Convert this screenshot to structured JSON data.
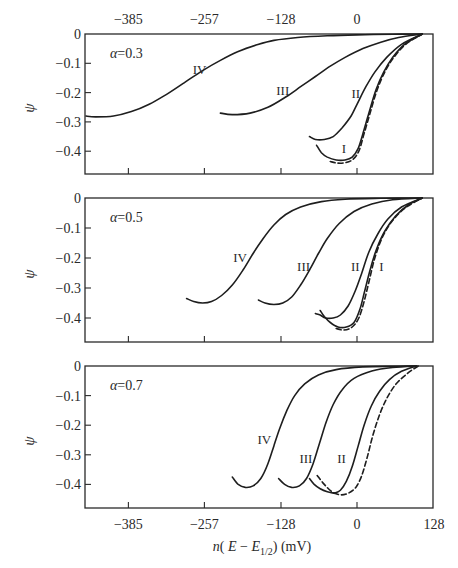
{
  "chart_data": {
    "type": "line",
    "title": "",
    "xlabel": "n(E − E1/2)  (mV)",
    "ylabel": "ψ",
    "x_ticks": [
      -385,
      -257,
      -128,
      0,
      128
    ],
    "x_tick_labels_top": [
      "−385",
      "−257",
      "−128",
      "0"
    ],
    "x_tick_labels_bottom": [
      "−385",
      "−257",
      "−128",
      "0",
      "128"
    ],
    "y_ticks": [
      0,
      -0.1,
      -0.2,
      -0.3,
      -0.4
    ],
    "y_tick_labels": [
      "0",
      "−0.1",
      "−0.2",
      "−0.3",
      "−0.4"
    ],
    "xlim": [
      -385,
      128
    ],
    "ylim": [
      -0.47,
      0
    ],
    "grid": false,
    "legend": "curve labels I, II, III, IV placed inline; dashed line = reference curve",
    "panels": [
      {
        "annotation": "α = 0.3",
        "series": [
          {
            "name": "IV",
            "style": "solid",
            "label_pos": [
              -265,
              -0.12
            ],
            "points": [
              [
                -460,
                -0.28
              ],
              [
                -440,
                -0.283
              ],
              [
                -410,
                -0.28
              ],
              [
                -380,
                -0.265
              ],
              [
                -350,
                -0.24
              ],
              [
                -320,
                -0.205
              ],
              [
                -290,
                -0.165
              ],
              [
                -260,
                -0.125
              ],
              [
                -230,
                -0.09
              ],
              [
                -200,
                -0.06
              ],
              [
                -170,
                -0.038
              ],
              [
                -140,
                -0.022
              ],
              [
                -100,
                -0.012
              ],
              [
                -50,
                -0.006
              ],
              [
                0,
                -0.003
              ],
              [
                60,
                -0.001
              ],
              [
                110,
                0
              ]
            ]
          },
          {
            "name": "III",
            "style": "solid",
            "label_pos": [
              -125,
              -0.19
            ],
            "points": [
              [
                -230,
                -0.27
              ],
              [
                -210,
                -0.275
              ],
              [
                -180,
                -0.27
              ],
              [
                -150,
                -0.25
              ],
              [
                -120,
                -0.215
              ],
              [
                -95,
                -0.18
              ],
              [
                -70,
                -0.145
              ],
              [
                -45,
                -0.11
              ],
              [
                -20,
                -0.08
              ],
              [
                10,
                -0.05
              ],
              [
                40,
                -0.028
              ],
              [
                70,
                -0.012
              ],
              [
                110,
                0
              ]
            ]
          },
          {
            "name": "II",
            "style": "solid",
            "label_pos": [
              -2,
              -0.2
            ],
            "points": [
              [
                -80,
                -0.35
              ],
              [
                -70,
                -0.36
              ],
              [
                -55,
                -0.36
              ],
              [
                -40,
                -0.35
              ],
              [
                -25,
                -0.32
              ],
              [
                -10,
                -0.28
              ],
              [
                0,
                -0.24
              ],
              [
                15,
                -0.18
              ],
              [
                30,
                -0.13
              ],
              [
                50,
                -0.08
              ],
              [
                75,
                -0.035
              ],
              [
                110,
                0
              ]
            ]
          },
          {
            "name": "I",
            "style": "solid",
            "label_pos": [
              -22,
              -0.39
            ],
            "points": [
              [
                -68,
                -0.38
              ],
              [
                -60,
                -0.405
              ],
              [
                -50,
                -0.42
              ],
              [
                -35,
                -0.43
              ],
              [
                -20,
                -0.43
              ],
              [
                -8,
                -0.42
              ],
              [
                2,
                -0.39
              ],
              [
                10,
                -0.34
              ],
              [
                20,
                -0.27
              ],
              [
                32,
                -0.19
              ],
              [
                45,
                -0.13
              ],
              [
                60,
                -0.08
              ],
              [
                80,
                -0.035
              ],
              [
                110,
                0
              ]
            ]
          },
          {
            "name": "reference",
            "style": "dashed",
            "label_pos": null,
            "points": [
              [
                -45,
                -0.435
              ],
              [
                -35,
                -0.44
              ],
              [
                -22,
                -0.44
              ],
              [
                -8,
                -0.43
              ],
              [
                3,
                -0.4
              ],
              [
                12,
                -0.34
              ],
              [
                22,
                -0.27
              ],
              [
                34,
                -0.19
              ],
              [
                48,
                -0.125
              ],
              [
                62,
                -0.08
              ],
              [
                82,
                -0.035
              ],
              [
                110,
                0
              ]
            ]
          }
        ]
      },
      {
        "annotation": "α = 0.5",
        "series": [
          {
            "name": "IV",
            "style": "solid",
            "label_pos": [
              -197,
              -0.195
            ],
            "points": [
              [
                -287,
                -0.335
              ],
              [
                -275,
                -0.345
              ],
              [
                -260,
                -0.35
              ],
              [
                -245,
                -0.345
              ],
              [
                -228,
                -0.325
              ],
              [
                -210,
                -0.29
              ],
              [
                -192,
                -0.24
              ],
              [
                -175,
                -0.185
              ],
              [
                -158,
                -0.135
              ],
              [
                -140,
                -0.09
              ],
              [
                -120,
                -0.055
              ],
              [
                -95,
                -0.03
              ],
              [
                -60,
                -0.012
              ],
              [
                -20,
                -0.004
              ],
              [
                40,
                -0.001
              ],
              [
                110,
                0
              ]
            ]
          },
          {
            "name": "III",
            "style": "solid",
            "label_pos": [
              -90,
              -0.225
            ],
            "points": [
              [
                -166,
                -0.34
              ],
              [
                -155,
                -0.35
              ],
              [
                -140,
                -0.355
              ],
              [
                -125,
                -0.35
              ],
              [
                -110,
                -0.33
              ],
              [
                -95,
                -0.29
              ],
              [
                -80,
                -0.24
              ],
              [
                -65,
                -0.185
              ],
              [
                -50,
                -0.135
              ],
              [
                -30,
                -0.085
              ],
              [
                -5,
                -0.045
              ],
              [
                25,
                -0.02
              ],
              [
                60,
                -0.006
              ],
              [
                110,
                0
              ]
            ]
          },
          {
            "name": "II",
            "style": "solid",
            "label_pos": [
              -3,
              -0.225
            ],
            "points": [
              [
                -70,
                -0.385
              ],
              [
                -62,
                -0.39
              ],
              [
                -53,
                -0.4
              ],
              [
                -40,
                -0.4
              ],
              [
                -28,
                -0.39
              ],
              [
                -15,
                -0.36
              ],
              [
                -3,
                -0.31
              ],
              [
                8,
                -0.25
              ],
              [
                20,
                -0.18
              ],
              [
                35,
                -0.12
              ],
              [
                52,
                -0.07
              ],
              [
                75,
                -0.03
              ],
              [
                110,
                0
              ]
            ]
          },
          {
            "name": "I",
            "style": "solid",
            "label_pos": [
              41,
              -0.225
            ],
            "points": [
              [
                -62,
                -0.375
              ],
              [
                -55,
                -0.395
              ],
              [
                -45,
                -0.415
              ],
              [
                -32,
                -0.43
              ],
              [
                -18,
                -0.43
              ],
              [
                -5,
                -0.415
              ],
              [
                5,
                -0.37
              ],
              [
                13,
                -0.31
              ],
              [
                22,
                -0.24
              ],
              [
                33,
                -0.17
              ],
              [
                47,
                -0.11
              ],
              [
                65,
                -0.06
              ],
              [
                85,
                -0.025
              ],
              [
                110,
                0
              ]
            ]
          },
          {
            "name": "reference",
            "style": "dashed",
            "label_pos": null,
            "points": [
              [
                -35,
                -0.435
              ],
              [
                -22,
                -0.44
              ],
              [
                -8,
                -0.43
              ],
              [
                3,
                -0.4
              ],
              [
                12,
                -0.345
              ],
              [
                20,
                -0.28
              ],
              [
                30,
                -0.2
              ],
              [
                43,
                -0.13
              ],
              [
                60,
                -0.075
              ],
              [
                82,
                -0.032
              ],
              [
                110,
                0
              ]
            ]
          }
        ]
      },
      {
        "annotation": "α = 0.7",
        "series": [
          {
            "name": "IV",
            "style": "solid",
            "label_pos": [
              -156,
              -0.245
            ],
            "points": [
              [
                -210,
                -0.375
              ],
              [
                -200,
                -0.4
              ],
              [
                -188,
                -0.41
              ],
              [
                -175,
                -0.405
              ],
              [
                -162,
                -0.38
              ],
              [
                -150,
                -0.33
              ],
              [
                -140,
                -0.27
              ],
              [
                -130,
                -0.21
              ],
              [
                -118,
                -0.15
              ],
              [
                -105,
                -0.1
              ],
              [
                -88,
                -0.06
              ],
              [
                -65,
                -0.03
              ],
              [
                -35,
                -0.012
              ],
              [
                10,
                -0.003
              ],
              [
                60,
                -0.001
              ],
              [
                100,
                0
              ]
            ]
          },
          {
            "name": "III",
            "style": "solid",
            "label_pos": [
              -86,
              -0.31
            ],
            "points": [
              [
                -132,
                -0.38
              ],
              [
                -122,
                -0.4
              ],
              [
                -110,
                -0.41
              ],
              [
                -97,
                -0.405
              ],
              [
                -85,
                -0.38
              ],
              [
                -74,
                -0.33
              ],
              [
                -63,
                -0.26
              ],
              [
                -52,
                -0.19
              ],
              [
                -40,
                -0.13
              ],
              [
                -25,
                -0.08
              ],
              [
                -5,
                -0.042
              ],
              [
                25,
                -0.017
              ],
              [
                60,
                -0.005
              ],
              [
                100,
                0
              ]
            ]
          },
          {
            "name": "III-to-II branch",
            "style": "solid",
            "label_pos": null,
            "points": [
              [
                -80,
                -0.38
              ],
              [
                -72,
                -0.4
              ],
              [
                -62,
                -0.415
              ],
              [
                -50,
                -0.425
              ],
              [
                -38,
                -0.43
              ]
            ]
          },
          {
            "name": "II",
            "style": "solid",
            "label_pos": [
              -26,
              -0.31
            ],
            "points": [
              [
                -38,
                -0.43
              ],
              [
                -28,
                -0.42
              ],
              [
                -18,
                -0.39
              ],
              [
                -8,
                -0.34
              ],
              [
                2,
                -0.27
              ],
              [
                12,
                -0.2
              ],
              [
                24,
                -0.135
              ],
              [
                38,
                -0.085
              ],
              [
                55,
                -0.045
              ],
              [
                75,
                -0.018
              ],
              [
                100,
                0
              ]
            ]
          },
          {
            "name": "reference",
            "style": "dashed",
            "label_pos": null,
            "points": [
              [
                -67,
                -0.37
              ],
              [
                -55,
                -0.4
              ],
              [
                -42,
                -0.425
              ],
              [
                -28,
                -0.435
              ],
              [
                -15,
                -0.43
              ],
              [
                -2,
                -0.41
              ],
              [
                8,
                -0.37
              ],
              [
                17,
                -0.31
              ],
              [
                26,
                -0.24
              ],
              [
                37,
                -0.17
              ],
              [
                50,
                -0.11
              ],
              [
                66,
                -0.06
              ],
              [
                85,
                -0.025
              ],
              [
                103,
                0
              ]
            ]
          }
        ]
      }
    ]
  },
  "layout": {
    "x_zero_px": 357,
    "px_per_mV": 0.5938,
    "frame_left_px": 85,
    "frame_right_px": 433,
    "panels_px": [
      {
        "top": 34,
        "bottom": 174,
        "px_per_unit": 293
      },
      {
        "top": 198,
        "bottom": 342,
        "px_per_unit": 300
      },
      {
        "top": 366,
        "bottom": 508,
        "px_per_unit": 296
      }
    ]
  }
}
